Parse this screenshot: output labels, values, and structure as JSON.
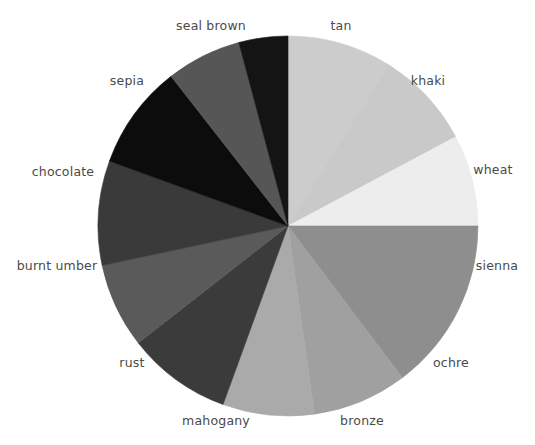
{
  "chart_data": {
    "type": "pie",
    "title": "",
    "xlabel": "",
    "ylabel": "",
    "legend_position": "outside-labels",
    "grid": false,
    "start_angle_deg": 0,
    "direction": "clockwise",
    "center": {
      "x": 288,
      "y": 226
    },
    "radius": 190,
    "total": 360,
    "categories": [
      "tan",
      "khaki",
      "wheat",
      "sienna",
      "ochre",
      "bronze",
      "mahogany",
      "rust",
      "burnt umber",
      "chocolate",
      "sepia",
      "seal brown"
    ],
    "values": [
      32,
      30,
      28,
      53,
      29,
      28,
      32,
      26,
      32,
      32,
      23,
      15
    ],
    "colors": [
      "#cccccc",
      "#c9c9c9",
      "#ededed",
      "#8e8e8e",
      "#a0a0a0",
      "#aaaaaa",
      "#3b3b3b",
      "#5a5a5a",
      "#3a3a3a",
      "#0c0c0c",
      "#565656",
      "#141414"
    ],
    "slices": [
      {
        "label": "tan",
        "value": 32,
        "color": "#cccccc",
        "start_deg": 0,
        "end_deg": 32,
        "label_x": 341,
        "label_y": 26,
        "align": "center"
      },
      {
        "label": "khaki",
        "value": 30,
        "color": "#c9c9c9",
        "start_deg": 32,
        "end_deg": 62,
        "label_x": 428,
        "label_y": 81,
        "align": "center"
      },
      {
        "label": "wheat",
        "value": 28,
        "color": "#ededed",
        "start_deg": 62,
        "end_deg": 90,
        "label_x": 493,
        "label_y": 170,
        "align": "center"
      },
      {
        "label": "sienna",
        "value": 53,
        "color": "#8e8e8e",
        "start_deg": 90,
        "end_deg": 143,
        "label_x": 497,
        "label_y": 266,
        "align": "center"
      },
      {
        "label": "ochre",
        "value": 29,
        "color": "#a0a0a0",
        "start_deg": 143,
        "end_deg": 172,
        "label_x": 451,
        "label_y": 363,
        "align": "center"
      },
      {
        "label": "bronze",
        "value": 28,
        "color": "#aaaaaa",
        "start_deg": 172,
        "end_deg": 200,
        "label_x": 362,
        "label_y": 421,
        "align": "center"
      },
      {
        "label": "mahogany",
        "value": 32,
        "color": "#3b3b3b",
        "start_deg": 200,
        "end_deg": 232,
        "label_x": 216,
        "label_y": 421,
        "align": "center"
      },
      {
        "label": "rust",
        "value": 26,
        "color": "#5a5a5a",
        "start_deg": 232,
        "end_deg": 258,
        "label_x": 132,
        "label_y": 363,
        "align": "center"
      },
      {
        "label": "burnt umber",
        "value": 32,
        "color": "#3a3a3a",
        "start_deg": 258,
        "end_deg": 290,
        "label_x": 57,
        "label_y": 266,
        "align": "center"
      },
      {
        "label": "chocolate",
        "value": 32,
        "color": "#0c0c0c",
        "start_deg": 290,
        "end_deg": 322,
        "label_x": 63,
        "label_y": 172,
        "align": "center"
      },
      {
        "label": "sepia",
        "value": 23,
        "color": "#565656",
        "start_deg": 322,
        "end_deg": 345,
        "label_x": 127,
        "label_y": 81,
        "align": "center"
      },
      {
        "label": "seal brown",
        "value": 15,
        "color": "#141414",
        "start_deg": 345,
        "end_deg": 360,
        "label_x": 211,
        "label_y": 26,
        "align": "center"
      }
    ],
    "label_color": "#4a4a4a",
    "background": "#ffffff"
  }
}
